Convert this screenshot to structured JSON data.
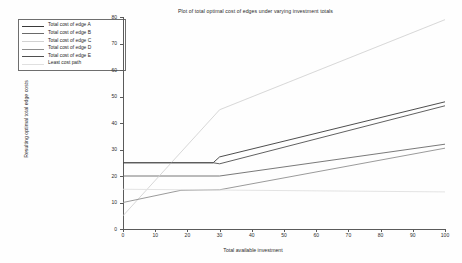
{
  "chart_data": {
    "type": "line",
    "title": "Plot of total optimal cost of edges under varying investment totals",
    "xlabel": "Total available investment",
    "ylabel": "Resulting optimal total edge costs",
    "xlim": [
      0,
      100
    ],
    "ylim": [
      0,
      80
    ],
    "xticks": [
      0,
      10,
      20,
      30,
      40,
      50,
      60,
      70,
      80,
      90,
      100
    ],
    "yticks": [
      0,
      10,
      20,
      30,
      40,
      50,
      60,
      70,
      80
    ],
    "grid": false,
    "legend_position": "upper-left-outside",
    "series": [
      {
        "name": "Total cost of edge A",
        "color": "#3a3a3a",
        "x": [
          0,
          28,
          30,
          100
        ],
        "y": [
          25,
          25,
          27.2,
          48.0
        ]
      },
      {
        "name": "Total cost of edge B",
        "color": "#6a6a6a",
        "x": [
          0,
          30,
          100
        ],
        "y": [
          20,
          20,
          32.0
        ]
      },
      {
        "name": "Total cost of edge C",
        "color": "#d2d2d2",
        "x": [
          0,
          30,
          100
        ],
        "y": [
          5,
          45.0,
          79.0
        ]
      },
      {
        "name": "Total cost of edge D",
        "color": "#8e8e8e",
        "x": [
          0,
          18,
          30,
          100
        ],
        "y": [
          10,
          14.6,
          14.8,
          30.5
        ]
      },
      {
        "name": "Total cost of edge E",
        "color": "#4f4f4f",
        "x": [
          0,
          28,
          30,
          100
        ],
        "y": [
          25,
          25,
          24.6,
          46.5
        ]
      },
      {
        "name": "Least cost path",
        "color": "#e0e0e0",
        "x": [
          0,
          100
        ],
        "y": [
          15,
          14.0
        ]
      }
    ]
  },
  "legend": {
    "items": [
      {
        "label": "Total cost of edge A",
        "color": "#3a3a3a"
      },
      {
        "label": "Total cost of edge B",
        "color": "#6a6a6a"
      },
      {
        "label": "Total cost of edge C",
        "color": "#d2d2d2"
      },
      {
        "label": "Total cost of edge D",
        "color": "#8e8e8e"
      },
      {
        "label": "Total cost of edge E",
        "color": "#4f4f4f"
      },
      {
        "label": "Least cost path",
        "color": "#e0e0e0"
      }
    ]
  },
  "axes": {
    "frame_color": "#5a5a5a",
    "text_color": "#2b2b2b"
  }
}
